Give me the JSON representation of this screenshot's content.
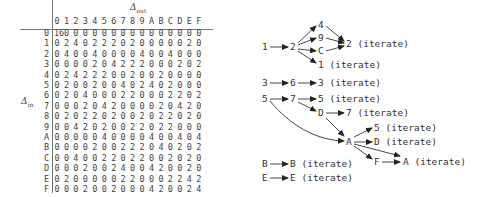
{
  "ddt_table": {
    "col_axis_label": "Δ",
    "col_axis_sub": "out",
    "row_axis_label": "Δ",
    "row_axis_sub": "in",
    "col_headers": [
      "0",
      "1",
      "2",
      "3",
      "4",
      "5",
      "6",
      "7",
      "8",
      "9",
      "A",
      "B",
      "C",
      "D",
      "E",
      "F"
    ],
    "rows": [
      {
        "label": "0",
        "values": [
          "16",
          "0",
          "0",
          "0",
          "0",
          "0",
          "0",
          "0",
          "0",
          "0",
          "0",
          "0",
          "0",
          "0",
          "0",
          "0"
        ]
      },
      {
        "label": "1",
        "values": [
          "0",
          "2",
          "4",
          "0",
          "2",
          "2",
          "2",
          "0",
          "2",
          "0",
          "0",
          "0",
          "0",
          "0",
          "2",
          "0"
        ]
      },
      {
        "label": "2",
        "values": [
          "0",
          "4",
          "0",
          "0",
          "4",
          "0",
          "0",
          "0",
          "0",
          "4",
          "0",
          "0",
          "4",
          "0",
          "0",
          "0"
        ]
      },
      {
        "label": "3",
        "values": [
          "0",
          "0",
          "0",
          "0",
          "2",
          "0",
          "4",
          "2",
          "2",
          "2",
          "0",
          "0",
          "0",
          "2",
          "0",
          "2"
        ]
      },
      {
        "label": "4",
        "values": [
          "0",
          "2",
          "4",
          "2",
          "2",
          "2",
          "0",
          "0",
          "2",
          "0",
          "0",
          "2",
          "0",
          "0",
          "0",
          "0"
        ]
      },
      {
        "label": "5",
        "values": [
          "0",
          "2",
          "0",
          "0",
          "2",
          "0",
          "0",
          "4",
          "0",
          "2",
          "4",
          "0",
          "2",
          "0",
          "0",
          "0"
        ]
      },
      {
        "label": "6",
        "values": [
          "0",
          "2",
          "0",
          "4",
          "0",
          "0",
          "0",
          "2",
          "2",
          "0",
          "0",
          "0",
          "2",
          "2",
          "0",
          "2"
        ]
      },
      {
        "label": "7",
        "values": [
          "0",
          "0",
          "0",
          "2",
          "0",
          "4",
          "2",
          "0",
          "0",
          "0",
          "0",
          "2",
          "0",
          "4",
          "2",
          "0"
        ]
      },
      {
        "label": "8",
        "values": [
          "0",
          "2",
          "0",
          "2",
          "2",
          "0",
          "2",
          "0",
          "0",
          "2",
          "0",
          "2",
          "2",
          "0",
          "2",
          "0"
        ]
      },
      {
        "label": "9",
        "values": [
          "0",
          "0",
          "4",
          "2",
          "0",
          "2",
          "0",
          "0",
          "2",
          "2",
          "0",
          "2",
          "2",
          "0",
          "0",
          "0"
        ]
      },
      {
        "label": "A",
        "values": [
          "0",
          "0",
          "0",
          "0",
          "0",
          "4",
          "0",
          "0",
          "0",
          "0",
          "4",
          "0",
          "0",
          "4",
          "0",
          "4"
        ]
      },
      {
        "label": "B",
        "values": [
          "0",
          "0",
          "0",
          "0",
          "2",
          "0",
          "0",
          "2",
          "2",
          "2",
          "0",
          "4",
          "0",
          "2",
          "0",
          "2"
        ]
      },
      {
        "label": "C",
        "values": [
          "0",
          "0",
          "4",
          "0",
          "0",
          "2",
          "2",
          "0",
          "2",
          "2",
          "0",
          "0",
          "2",
          "0",
          "2",
          "0"
        ]
      },
      {
        "label": "D",
        "values": [
          "0",
          "0",
          "0",
          "2",
          "0",
          "0",
          "2",
          "4",
          "0",
          "0",
          "4",
          "2",
          "0",
          "0",
          "2",
          "0"
        ]
      },
      {
        "label": "E",
        "values": [
          "0",
          "2",
          "0",
          "0",
          "0",
          "0",
          "0",
          "2",
          "2",
          "0",
          "0",
          "0",
          "2",
          "2",
          "4",
          "2"
        ]
      },
      {
        "label": "F",
        "values": [
          "0",
          "0",
          "0",
          "2",
          "0",
          "0",
          "2",
          "0",
          "0",
          "0",
          "4",
          "2",
          "0",
          "0",
          "2",
          "4"
        ]
      }
    ]
  },
  "diagram": {
    "nodes": [
      {
        "id": "n1",
        "text": "1",
        "x": 262,
        "y": 41
      },
      {
        "id": "n1-2",
        "text": "2",
        "x": 290,
        "y": 41
      },
      {
        "id": "n4",
        "text": "4",
        "x": 318,
        "y": 19
      },
      {
        "id": "n9",
        "text": "9",
        "x": 318,
        "y": 32
      },
      {
        "id": "nC",
        "text": "C",
        "x": 318,
        "y": 45
      },
      {
        "id": "n1it",
        "text": "1 (iterate)",
        "x": 318,
        "y": 59
      },
      {
        "id": "n2it",
        "text": "2 (iterate)",
        "x": 346,
        "y": 38
      },
      {
        "id": "n3",
        "text": "3",
        "x": 262,
        "y": 77
      },
      {
        "id": "n6",
        "text": "6",
        "x": 290,
        "y": 77
      },
      {
        "id": "n3it",
        "text": "3 (iterate)",
        "x": 318,
        "y": 77
      },
      {
        "id": "n5",
        "text": "5",
        "x": 262,
        "y": 93
      },
      {
        "id": "n7",
        "text": "7",
        "x": 290,
        "y": 93
      },
      {
        "id": "n5it",
        "text": "5 (iterate)",
        "x": 318,
        "y": 93
      },
      {
        "id": "nD",
        "text": "D",
        "x": 318,
        "y": 107
      },
      {
        "id": "n7it",
        "text": "7 (iterate)",
        "x": 346,
        "y": 107
      },
      {
        "id": "nA",
        "text": "A",
        "x": 346,
        "y": 136
      },
      {
        "id": "n5it2",
        "text": "5 (iterate)",
        "x": 374,
        "y": 122
      },
      {
        "id": "nDit",
        "text": "D (iterate)",
        "x": 374,
        "y": 136
      },
      {
        "id": "nF",
        "text": "F",
        "x": 374,
        "y": 156
      },
      {
        "id": "nAit",
        "text": "A (iterate)",
        "x": 403,
        "y": 156
      },
      {
        "id": "nB",
        "text": "B",
        "x": 262,
        "y": 158
      },
      {
        "id": "nBit",
        "text": "B (iterate)",
        "x": 290,
        "y": 158
      },
      {
        "id": "nE",
        "text": "E",
        "x": 262,
        "y": 172
      },
      {
        "id": "nEit",
        "text": "E (iterate)",
        "x": 290,
        "y": 172
      }
    ]
  }
}
